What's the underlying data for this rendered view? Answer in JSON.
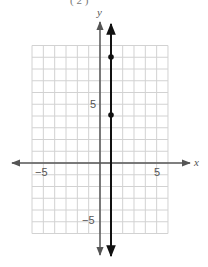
{
  "header_fragment": "(      2 )",
  "chart_data": {
    "type": "line",
    "title": "",
    "xlabel": "x",
    "ylabel": "y",
    "xlim": [
      -6,
      6
    ],
    "ylim": [
      -6,
      10
    ],
    "grid": true,
    "x_tick_labels": [
      {
        "value": -5,
        "label": "−5"
      },
      {
        "value": 5,
        "label": "5"
      }
    ],
    "y_tick_labels": [
      {
        "value": 5,
        "label": "5"
      },
      {
        "value": -5,
        "label": "−5"
      }
    ],
    "series": [
      {
        "name": "vertical line x = 1",
        "equation": "x = 1",
        "style": "line with arrows at both ends",
        "color": "#111111",
        "points": [
          {
            "x": 1,
            "y": 9
          },
          {
            "x": 1,
            "y": 4
          }
        ]
      }
    ],
    "colors": {
      "grid": "#d2d2d2",
      "axes": "#555555",
      "line": "#111111"
    }
  }
}
